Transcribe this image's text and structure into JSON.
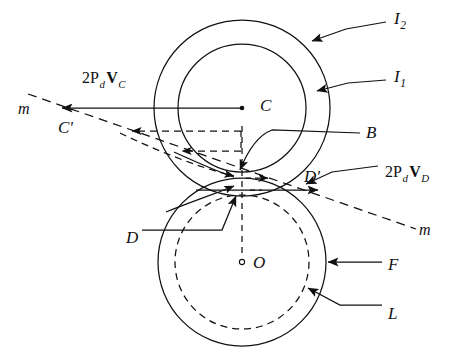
{
  "figure": {
    "background_color": "#ffffff",
    "line_color": "#111111",
    "width": 453,
    "height": 360
  },
  "geometry": {
    "upper_center": {
      "label": "C",
      "x": 242,
      "y": 108
    },
    "lower_center": {
      "label": "O",
      "x": 242,
      "y": 262
    },
    "contact_point": {
      "label": "B",
      "x": 242,
      "y": 178
    },
    "circles": [
      {
        "name": "I2",
        "cx": 242,
        "cy": 108,
        "r": 88,
        "style": "solid"
      },
      {
        "name": "I1",
        "cx": 242,
        "cy": 108,
        "r": 64,
        "style": "solid"
      },
      {
        "name": "F",
        "cx": 242,
        "cy": 262,
        "r": 84,
        "style": "solid"
      },
      {
        "name": "L",
        "cx": 242,
        "cy": 262,
        "r": 67,
        "style": "dashed"
      }
    ]
  },
  "labels": {
    "i2": {
      "text": "I",
      "sub": "2",
      "x": 394,
      "y": 16
    },
    "i1": {
      "text": "I",
      "sub": "1",
      "x": 394,
      "y": 74
    },
    "b": {
      "text": "B",
      "x": 366,
      "y": 124
    },
    "c": {
      "text": "C",
      "x": 260,
      "y": 97
    },
    "cprime": {
      "text": "C'",
      "x": 60,
      "y": 119
    },
    "m_left": {
      "text": "m",
      "x": 20,
      "y": 101
    },
    "m_right": {
      "text": "m",
      "x": 420,
      "y": 224
    },
    "d": {
      "text": "D",
      "x": 128,
      "y": 230
    },
    "dprime": {
      "text": "D'",
      "x": 305,
      "y": 169
    },
    "o": {
      "text": "O",
      "x": 254,
      "y": 255
    },
    "f": {
      "text": "F",
      "x": 389,
      "y": 258
    },
    "l": {
      "text": "L",
      "x": 389,
      "y": 307
    },
    "vc": {
      "prefix": "2P",
      "sub1": "d",
      "vector": "V",
      "sub2": "C",
      "x": 83,
      "y": 72
    },
    "vd": {
      "prefix": "2P",
      "sub1": "d",
      "vector": "V",
      "sub2": "D",
      "x": 386,
      "y": 166
    }
  },
  "vectors": [
    {
      "name": "V_C",
      "from_x": 242,
      "from_y": 108,
      "to_x": 58,
      "to_y": 108,
      "style": "solid",
      "arrow": "end"
    },
    {
      "name": "V_D",
      "from_x": 242,
      "from_y": 190,
      "to_x": 330,
      "to_y": 190,
      "style": "solid",
      "arrow": "end"
    },
    {
      "name": "dashed-upper",
      "from_x": 242,
      "from_y": 131,
      "to_x": 128,
      "to_y": 131,
      "style": "dashed",
      "arrow": "end"
    },
    {
      "name": "dashed-lower",
      "from_x": 242,
      "from_y": 150,
      "to_x": 178,
      "to_y": 150,
      "style": "dashed",
      "arrow": "end"
    },
    {
      "name": "dashed-short-right",
      "from_x": 242,
      "from_y": 178,
      "to_x": 272,
      "to_y": 178,
      "style": "dashed",
      "arrow": "end"
    }
  ],
  "lines": {
    "m_axis": {
      "name": "line-m",
      "x1": 30,
      "y1": 95,
      "x2": 414,
      "y2": 228,
      "style": "dashed"
    },
    "center_line": {
      "name": "center-line-vertical",
      "x1": 242,
      "y1": 128,
      "x2": 242,
      "y2": 262,
      "style": "dashed"
    }
  },
  "leaders": [
    {
      "name": "leader-i2",
      "target": "I2-circle"
    },
    {
      "name": "leader-i1",
      "target": "I1-circle"
    },
    {
      "name": "leader-b",
      "target": "contact-point-B"
    },
    {
      "name": "leader-d",
      "target": "point-D"
    },
    {
      "name": "leader-dprime",
      "target": "point-D-prime"
    },
    {
      "name": "leader-f",
      "target": "F-circle"
    },
    {
      "name": "leader-l",
      "target": "L-circle"
    }
  ]
}
